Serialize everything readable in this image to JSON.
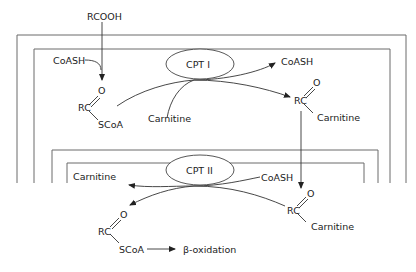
{
  "diagram": {
    "top": {
      "rcooh": "RCOOH",
      "coash_in": "CoASH",
      "acyl_coa": {
        "rc": "RC",
        "o": "O",
        "group": "SCoA"
      },
      "carnitine_in": "Carnitine",
      "enzyme": "CPT I",
      "coash_out": "CoASH",
      "acyl_carnitine": {
        "rc": "RC",
        "o": "O",
        "group": "Carnitine"
      }
    },
    "bottom": {
      "carnitine_out": "Carnitine",
      "enzyme": "CPT II",
      "coash_in": "CoASH",
      "acyl_carnitine": {
        "rc": "RC",
        "o": "O",
        "group": "Carnitine"
      },
      "acyl_coa": {
        "rc": "RC",
        "o": "O",
        "group": "SCoA"
      },
      "product": "β-oxidation"
    },
    "colors": {
      "frame": "#6b6b6b",
      "line": "#333333",
      "text": "#222222",
      "background": "#ffffff"
    }
  }
}
